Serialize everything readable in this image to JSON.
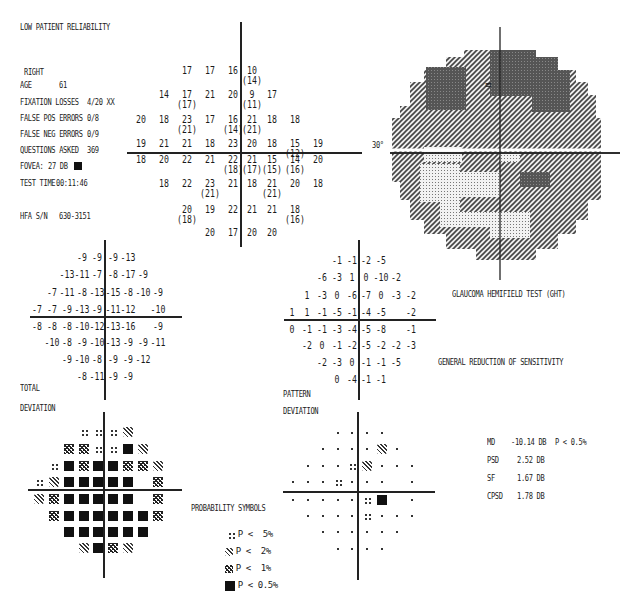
{
  "header": {
    "reliability_warning": "LOW PATIENT RELIABILITY",
    "eye": "RIGHT",
    "fields": [
      {
        "label": "AGE",
        "value": "61"
      },
      {
        "label": "FIXATION LOSSES",
        "value": "4/20 XX"
      },
      {
        "label": "FALSE POS ERRORS",
        "value": "0/8"
      },
      {
        "label": "FALSE NEG ERRORS",
        "value": "0/9"
      },
      {
        "label": "QUESTIONS ASKED",
        "value": "369"
      },
      {
        "label": "FOVEA:",
        "value": "27 DB"
      },
      {
        "label": "TEST TIME",
        "value": "00:11:46"
      },
      {
        "label": "HFA S/N",
        "value": "630-3151"
      }
    ]
  },
  "threshold_grid": {
    "rows": [
      [
        null,
        null,
        "17",
        "17",
        "16",
        "10|14",
        null,
        null,
        null
      ],
      [
        null,
        "14",
        "17|17",
        "21",
        "20",
        "9|11",
        "17",
        null,
        null
      ],
      [
        "20",
        "18",
        "23|21",
        "17",
        "16|14",
        "21|21",
        "18",
        "18",
        null
      ],
      [
        "19",
        "21",
        "21",
        "18",
        "23",
        "20",
        "18",
        "15|12",
        "19"
      ],
      [
        "18",
        "20",
        "22",
        "21",
        "22|18",
        "21|17",
        "15|15",
        "14|16",
        "20"
      ],
      [
        null,
        "18",
        "22",
        "23|21",
        "21",
        "18",
        "21|21",
        "20",
        "18"
      ],
      [
        null,
        null,
        "20|18",
        "19",
        "22",
        "21",
        "21",
        "18|16",
        null
      ],
      [
        null,
        null,
        null,
        "20",
        "17",
        "20",
        "20",
        null,
        null
      ]
    ]
  },
  "gray_scale": {
    "axis_label": "30°",
    "title": "GLAUCOMA HEMIFIELD TEST (GHT)"
  },
  "ght_result": "GENERAL REDUCTION OF SENSITIVITY",
  "total_deviation": {
    "label_line1": "TOTAL",
    "label_line2": "DEVIATION",
    "rows": [
      [
        null,
        null,
        null,
        "-9",
        "-9",
        "-9",
        "-13",
        null,
        null
      ],
      [
        null,
        null,
        "-13",
        "-11",
        "-7",
        "-8",
        "-17",
        "-9",
        null
      ],
      [
        null,
        "-7",
        "-11",
        "-8",
        "-13",
        "-15",
        "-8",
        "-10",
        "-9"
      ],
      [
        "-7",
        "-7",
        "-9",
        "-13",
        "-9",
        "-11",
        "-12",
        null,
        "-10"
      ],
      [
        "-8",
        "-8",
        "-8",
        "-10",
        "-12",
        "-13",
        "-16",
        null,
        "-9"
      ],
      [
        null,
        "-10",
        "-8",
        "-9",
        "-10",
        "-13",
        "-9",
        "-9",
        "-11"
      ],
      [
        null,
        null,
        "-9",
        "-10",
        "-8",
        "-9",
        "-9",
        "-12",
        null
      ],
      [
        null,
        null,
        null,
        "-8",
        "-11",
        "-9",
        "-9",
        null,
        null
      ]
    ]
  },
  "pattern_deviation": {
    "label_line1": "PATTERN",
    "label_line2": "DEVIATION",
    "rows": [
      [
        null,
        null,
        null,
        "-1",
        "-1",
        "-2",
        "-5",
        null,
        null
      ],
      [
        null,
        null,
        "-6",
        "-3",
        "1",
        "0",
        "-10",
        "-2",
        null
      ],
      [
        null,
        "1",
        "-3",
        "0",
        "-6",
        "-7",
        "0",
        "-3",
        "-2"
      ],
      [
        "1",
        "1",
        "-1",
        "-5",
        "-1",
        "-4",
        "-5",
        null,
        "-2"
      ],
      [
        "0",
        "-1",
        "-1",
        "-3",
        "-4",
        "-5",
        "-8",
        null,
        "-1"
      ],
      [
        null,
        "-2",
        "0",
        "-1",
        "-2",
        "-5",
        "-2",
        "-2",
        "-3"
      ],
      [
        null,
        null,
        "-2",
        "-3",
        "0",
        "-1",
        "-1",
        "-5",
        null
      ],
      [
        null,
        null,
        null,
        "0",
        "-4",
        "-1",
        "-1",
        null,
        null
      ]
    ]
  },
  "total_deviation_symbols": {
    "rows": [
      [
        null,
        null,
        null,
        "p5",
        "p5",
        "p5",
        "p2",
        null,
        null
      ],
      [
        null,
        null,
        "p1",
        "p1",
        "p5",
        "p5",
        "p05",
        "p2",
        null
      ],
      [
        null,
        "p5",
        "p05",
        "p1",
        "p05",
        "p05",
        "p1",
        "p1",
        "p2"
      ],
      [
        "p5",
        "p2",
        "p05",
        "p05",
        "p05",
        "p05",
        "p05",
        null,
        "p1"
      ],
      [
        "p2",
        "p1",
        "p05",
        "p05",
        "p05",
        "p05",
        "p05",
        null,
        "p1"
      ],
      [
        null,
        "p1",
        "p05",
        "p05",
        "p05",
        "p05",
        "p05",
        "p05",
        "p1"
      ],
      [
        null,
        null,
        "p05",
        "p05",
        "p05",
        "p05",
        "p05",
        "p05",
        null
      ],
      [
        null,
        null,
        null,
        "p2",
        "p05",
        "p1",
        "p2",
        null,
        null
      ]
    ]
  },
  "pattern_deviation_symbols": {
    "rows": [
      [
        null,
        null,
        null,
        "n",
        "n",
        "n",
        "n",
        null,
        null
      ],
      [
        null,
        null,
        "n",
        "n",
        "n",
        "n",
        "p2",
        "n",
        null
      ],
      [
        null,
        "n",
        "n",
        "n",
        "p5",
        "p2",
        "n",
        "n",
        "n"
      ],
      [
        "n",
        "n",
        "n",
        "p5",
        "n",
        "n",
        "n",
        null,
        "n"
      ],
      [
        "n",
        "n",
        "n",
        "n",
        "n",
        "p5",
        "p05",
        null,
        "n"
      ],
      [
        null,
        "n",
        "n",
        "n",
        "n",
        "p5",
        "n",
        "n",
        "n"
      ],
      [
        null,
        null,
        "n",
        "n",
        "n",
        "n",
        "n",
        "n",
        null
      ],
      [
        null,
        null,
        null,
        "n",
        "n",
        "n",
        "n",
        null,
        null
      ]
    ]
  },
  "probability_legend": {
    "title": "PROBABILITY SYMBOLS",
    "items": [
      {
        "symbol": "p5",
        "label": "P <  5%"
      },
      {
        "symbol": "p2",
        "label": "P <  2%"
      },
      {
        "symbol": "p1",
        "label": "P <  1%"
      },
      {
        "symbol": "p05",
        "label": "P < 0.5%"
      }
    ]
  },
  "global_indices": [
    {
      "label": "MD",
      "value": "-10.14 DB",
      "p": "P < 0.5%"
    },
    {
      "label": "PSD",
      "value": "2.52 DB",
      "p": ""
    },
    {
      "label": "SF",
      "value": "1.67 DB",
      "p": ""
    },
    {
      "label": "CPSD",
      "value": "1.78 DB",
      "p": ""
    }
  ],
  "colors": {
    "ink": "#1a1a1a",
    "dark_region": "#5a5a5a",
    "mid_region": "#8c8c8c",
    "light_region": "#d0d0d0"
  }
}
